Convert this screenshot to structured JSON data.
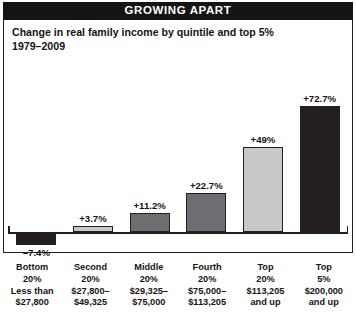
{
  "banner": {
    "title": "GROWING APART"
  },
  "subtitle": {
    "line1": "Change in real family income by quintile and top 5%",
    "line2": "1979–2009"
  },
  "colors": {
    "dark_bar": "#231f20",
    "mid_bar": "#6d6e71",
    "light_bar": "#c7c8ca",
    "banner_bg": "#141414",
    "text": "#141414",
    "axis": "#231f20"
  },
  "chart_data": {
    "type": "bar",
    "title": "GROWING APART",
    "subtitle": "Change in real family income by quintile and top 5% 1979–2009",
    "xlabel": "",
    "ylabel": "",
    "ylim": [
      -10,
      80
    ],
    "grid": false,
    "legend": "none",
    "categories": [
      "Bottom 20%",
      "Second 20%",
      "Middle 20%",
      "Fourth 20%",
      "Top 20%",
      "Top 5%"
    ],
    "category_lines": [
      [
        "Bottom",
        "20%",
        "Less than",
        "$27,800"
      ],
      [
        "Second",
        "20%",
        "$27,800–",
        "$49,325"
      ],
      [
        "Middle",
        "20%",
        "$29,325–",
        "$75,000"
      ],
      [
        "Fourth",
        "20%",
        "$75,000–",
        "$113,205"
      ],
      [
        "Top",
        "20%",
        "$113,205",
        "and up"
      ],
      [
        "Top",
        "5%",
        "$200,000",
        "and up"
      ]
    ],
    "values": [
      -7.4,
      3.7,
      11.2,
      22.7,
      49.0,
      72.7
    ],
    "value_labels": [
      "–7.4%",
      "+3.7%",
      "+11.2%",
      "+22.7%",
      "+49%",
      "+72.7%"
    ],
    "bar_colors": [
      "dark",
      "light",
      "mid",
      "mid",
      "light",
      "dark"
    ]
  }
}
